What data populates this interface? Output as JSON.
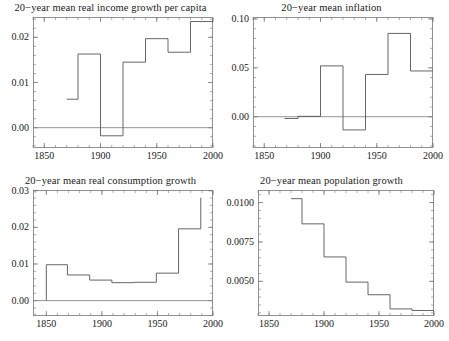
{
  "figure": {
    "background": "#ffffff",
    "line_color": "#555555",
    "frame_color": "#777777",
    "zero_line_color": "#888888"
  },
  "chart_data": [
    {
      "id": "income",
      "type": "line",
      "step": true,
      "title": "20−year mean real income growth per capita",
      "xlabel": "",
      "ylabel": "",
      "xlim": [
        1840,
        2000
      ],
      "ylim": [
        -0.0045,
        0.0245
      ],
      "grid": false,
      "legend": null,
      "xticks": [
        1850,
        1900,
        1950,
        2000
      ],
      "xtick_labels": [
        "1850",
        "1900",
        "1950",
        "2000"
      ],
      "yticks": [
        0.0,
        0.01,
        0.02
      ],
      "ytick_labels": [
        "0.00",
        "0.01",
        "0.02"
      ],
      "zero_line": 0.0,
      "x_edges": [
        1870,
        1880,
        1900,
        1920,
        1940,
        1960,
        1980,
        2000
      ],
      "values": [
        0.0063,
        0.0163,
        -0.0018,
        0.0145,
        0.0197,
        0.0167,
        0.0235
      ]
    },
    {
      "id": "inflation",
      "type": "line",
      "step": true,
      "title": "20−year mean inflation",
      "xlabel": "",
      "ylabel": "",
      "xlim": [
        1840,
        2000
      ],
      "ylim": [
        -0.032,
        0.102
      ],
      "grid": false,
      "legend": null,
      "xticks": [
        1850,
        1900,
        1950,
        2000
      ],
      "xtick_labels": [
        "1850",
        "1900",
        "1950",
        "2000"
      ],
      "yticks": [
        0.0,
        0.05,
        0.1
      ],
      "ytick_labels": [
        "0.00",
        "0.05",
        "0.10"
      ],
      "zero_line": 0.0,
      "x_edges": [
        1868,
        1880,
        1900,
        1920,
        1940,
        1960,
        1980,
        2000
      ],
      "values": [
        -0.0018,
        0.0004,
        0.052,
        -0.0135,
        0.0432,
        0.0852,
        0.0468
      ]
    },
    {
      "id": "consumption",
      "type": "line",
      "step": true,
      "title": "20−year mean real consumption growth",
      "xlabel": "",
      "ylabel": "",
      "xlim": [
        1838,
        2000
      ],
      "ylim": [
        -0.0042,
        0.0302
      ],
      "grid": false,
      "legend": null,
      "xticks": [
        1850,
        1900,
        1950,
        2000
      ],
      "xtick_labels": [
        "1850",
        "1900",
        "1950",
        "2000"
      ],
      "yticks": [
        0.0,
        0.01,
        0.02,
        0.03
      ],
      "ytick_labels": [
        "0.00",
        "0.01",
        "0.02",
        "0.03"
      ],
      "zero_line": 0.0,
      "x_edges": [
        1850,
        1869,
        1889,
        1909,
        1929,
        1949,
        1969,
        1989
      ],
      "values": [
        0.0098,
        0.007,
        0.0056,
        0.0049,
        0.005,
        0.0075,
        0.0196,
        0.0281
      ]
    },
    {
      "id": "population",
      "type": "line",
      "step": true,
      "title": "20−year mean population growth",
      "xlabel": "",
      "ylabel": "",
      "xlim": [
        1840,
        2000
      ],
      "ylim": [
        0.0028,
        0.0108
      ],
      "grid": false,
      "legend": null,
      "xticks": [
        1850,
        1900,
        1950,
        2000
      ],
      "xtick_labels": [
        "1850",
        "1900",
        "1950",
        "2000"
      ],
      "yticks": [
        0.005,
        0.0075,
        0.01
      ],
      "ytick_labels": [
        "0.0050",
        "0.0075",
        "0.0100"
      ],
      "zero_line": null,
      "x_edges": [
        1870,
        1880,
        1900,
        1920,
        1940,
        1960,
        1980,
        2000
      ],
      "values": [
        0.01025,
        0.00865,
        0.00655,
        0.00495,
        0.00415,
        0.00325,
        0.00315
      ]
    }
  ]
}
